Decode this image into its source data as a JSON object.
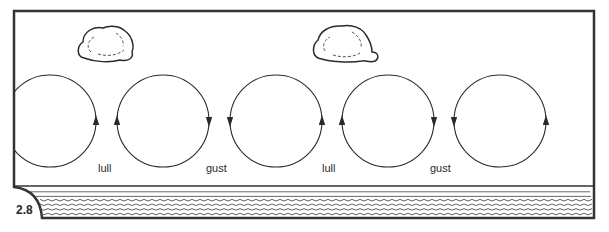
{
  "figure": {
    "number": "2.8"
  },
  "colors": {
    "line": "#2a2a2a",
    "frame": "#333333",
    "background": "#ffffff"
  },
  "clouds": [
    {
      "name": "cloud-left",
      "x": 79,
      "y": 26
    },
    {
      "name": "cloud-center",
      "x": 313,
      "y": 25
    }
  ],
  "eddies": [
    {
      "cx": 50,
      "arrows": [
        {
          "side": "right",
          "dir": "up"
        }
      ]
    },
    {
      "cx": 163,
      "arrows": [
        {
          "side": "left",
          "dir": "up"
        },
        {
          "side": "right",
          "dir": "down"
        }
      ]
    },
    {
      "cx": 276,
      "arrows": [
        {
          "side": "left",
          "dir": "down"
        },
        {
          "side": "right",
          "dir": "up"
        }
      ]
    },
    {
      "cx": 388,
      "arrows": [
        {
          "side": "left",
          "dir": "up"
        },
        {
          "side": "right",
          "dir": "down"
        }
      ]
    },
    {
      "cx": 500,
      "arrows": [
        {
          "side": "left",
          "dir": "down"
        },
        {
          "side": "right",
          "dir": "up"
        }
      ]
    }
  ],
  "labels": [
    {
      "text": "lull",
      "x": 98
    },
    {
      "text": "gust",
      "x": 206
    },
    {
      "text": "lull",
      "x": 322
    },
    {
      "text": "gust",
      "x": 430
    }
  ],
  "water": {
    "label": "water-surface",
    "wave_lines": 6
  }
}
